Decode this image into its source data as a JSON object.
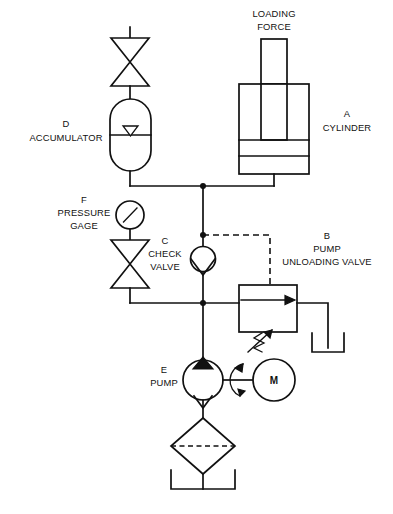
{
  "diagram": {
    "type": "hydraulic-schematic",
    "background_color": "#ffffff",
    "line_color": "#111111",
    "width": 393,
    "height": 514
  },
  "labels": {
    "loading_force": {
      "line1": "LOADING",
      "line2": "FORCE"
    },
    "cylinder": {
      "tag": "A",
      "name": "CYLINDER"
    },
    "accumulator": {
      "tag": "D",
      "name": "ACCUMULATOR"
    },
    "pressure_gage": {
      "tag": "F",
      "line1": "PRESSURE",
      "line2": "GAGE"
    },
    "check_valve": {
      "tag": "C",
      "line1": "CHECK",
      "line2": "VALVE"
    },
    "unloading_valve": {
      "tag": "B",
      "line1": "PUMP",
      "line2": "UNLOADING VALVE"
    },
    "pump": {
      "tag": "E",
      "name": "PUMP"
    },
    "motor": {
      "tag": "M"
    }
  },
  "components": [
    {
      "id": "A",
      "name": "CYLINDER",
      "kind": "double-acting-cylinder"
    },
    {
      "id": "B",
      "name": "PUMP UNLOADING VALVE",
      "kind": "unloading-valve"
    },
    {
      "id": "C",
      "name": "CHECK VALVE",
      "kind": "check-valve"
    },
    {
      "id": "D",
      "name": "ACCUMULATOR",
      "kind": "gas-charged-accumulator"
    },
    {
      "id": "E",
      "name": "PUMP",
      "kind": "fixed-displacement-pump"
    },
    {
      "id": "F",
      "name": "PRESSURE GAGE",
      "kind": "pressure-gauge"
    },
    {
      "id": "M",
      "name": "MOTOR",
      "kind": "electric-motor"
    }
  ]
}
